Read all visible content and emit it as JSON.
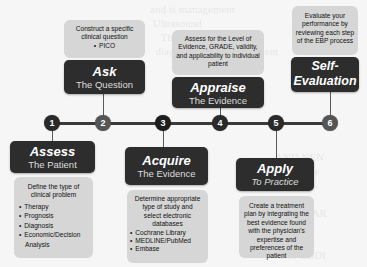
{
  "colors": {
    "dark_box": "#2d2d2d",
    "light_box": "#d6d6d6",
    "node_dark": "#2a2a2a",
    "node_mid": "#555555",
    "timeline": "#3a3a3a",
    "background": "#f6f6f6"
  },
  "steps": [
    {
      "number": "1",
      "title": "Assess",
      "subtitle": "The Patient",
      "description": "Define the type of clinical problem",
      "bullets": [
        "Therapy",
        "Prognosis",
        "Diagnosis",
        "Economic/Decision Analysis"
      ]
    },
    {
      "number": "2",
      "title": "Ask",
      "subtitle": "The Question",
      "description": "Construct a specific clinical question",
      "bullets": [
        "PICO"
      ]
    },
    {
      "number": "3",
      "title": "Acquire",
      "subtitle": "The Evidence",
      "description": "Determine appropriate type of study and select electronic databases",
      "bullets": [
        "Cochrane Library",
        "MEDLINE/PubMed",
        "Embase"
      ]
    },
    {
      "number": "4",
      "title": "Appraise",
      "subtitle": "The Evidence",
      "description": "Assess for the Level of Evidence, GRADE, validity, and applicability to individual patient",
      "bullets": []
    },
    {
      "number": "5",
      "title": "Apply",
      "subtitle": "To Practice",
      "description": "Create a treatment plan by integrating the best evidence found with the physician's expertise and preferences of the patient",
      "bullets": []
    },
    {
      "number": "6",
      "title": "Self-Evaluation",
      "subtitle": "",
      "description": "Evaluate your performance by reviewing each step of the EBP process",
      "bullets": []
    }
  ]
}
